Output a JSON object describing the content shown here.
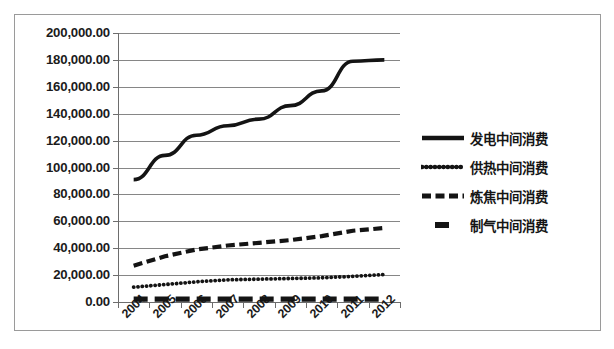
{
  "chart_data": {
    "type": "line",
    "title": "",
    "xlabel": "",
    "ylabel": "",
    "categories": [
      "2004",
      "2005",
      "2006",
      "2007",
      "2008",
      "2009",
      "2010",
      "2011",
      "2012"
    ],
    "y_tick_labels": [
      "200,000.00",
      "180,000.00",
      "160,000.00",
      "140,000.00",
      "120,000.00",
      "100,000.00",
      "80,000.00",
      "60,000.00",
      "40,000.00",
      "20,000.00",
      "0.00"
    ],
    "y_tick_values": [
      200000,
      180000,
      160000,
      140000,
      120000,
      100000,
      80000,
      60000,
      40000,
      20000,
      0
    ],
    "ylim": [
      0,
      200000
    ],
    "grid": true,
    "legend_position": "right",
    "series": [
      {
        "name": "发电中间消费",
        "style": "solid",
        "values": [
          91000,
          109000,
          124000,
          131000,
          136000,
          146000,
          157000,
          179000,
          180000
        ]
      },
      {
        "name": "供热中间消费",
        "style": "dotted",
        "values": [
          11000,
          13000,
          15000,
          16500,
          17000,
          17500,
          18000,
          19000,
          20500
        ]
      },
      {
        "name": "炼焦中间消费",
        "style": "dashed",
        "values": [
          27000,
          34000,
          39000,
          42000,
          44000,
          46000,
          49000,
          53000,
          55000
        ]
      },
      {
        "name": "制气中间消费",
        "style": "long-dash",
        "values": [
          2200,
          2200,
          2200,
          2200,
          2200,
          2200,
          2200,
          2200,
          2200
        ]
      }
    ]
  },
  "legend": {
    "items": [
      {
        "label": "发电中间消费",
        "style": "solid"
      },
      {
        "label": "供热中间消费",
        "style": "dotted"
      },
      {
        "label": "炼焦中间消费",
        "style": "dashed"
      },
      {
        "label": "制气中间消费",
        "style": "long-dash"
      }
    ]
  },
  "colors": {
    "series_line": "#141414",
    "gridline": "#868686",
    "axis": "#6d6d6d",
    "frame": "#9a9a9a",
    "background": "#ffffff",
    "text": "#1b1b1b"
  }
}
